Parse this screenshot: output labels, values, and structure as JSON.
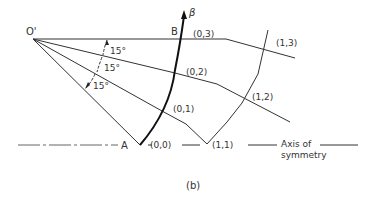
{
  "figure": {
    "caption": "(b)",
    "points": {
      "o_prime": "O'",
      "a": "A",
      "b": "B",
      "beta": "β"
    },
    "nodes": {
      "n00": "(0,0)",
      "n01": "(0,1)",
      "n02": "(0,2)",
      "n03": "(0,3)",
      "n11": "(1,1)",
      "n12": "(1,2)",
      "n13": "(1,3)"
    },
    "angles": [
      "15°",
      "15°",
      "15°"
    ],
    "axis_label_line1": "Axis of",
    "axis_label_line2": "symmetry"
  }
}
